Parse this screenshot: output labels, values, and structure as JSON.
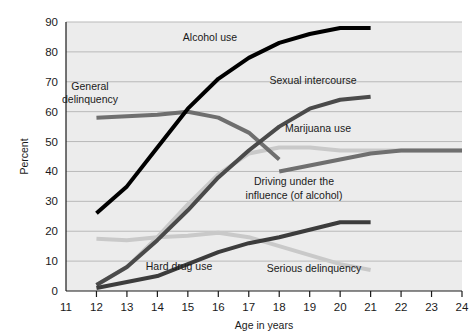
{
  "chart_data": {
    "type": "line",
    "title": "",
    "xlabel": "Age in years",
    "ylabel": "Percent",
    "xlim": [
      11,
      24
    ],
    "ylim": [
      0,
      90
    ],
    "xticks": [
      11,
      12,
      13,
      14,
      15,
      16,
      17,
      18,
      19,
      20,
      21,
      22,
      23,
      24
    ],
    "yticks": [
      0,
      10,
      20,
      30,
      40,
      50,
      60,
      70,
      80,
      90
    ],
    "grid": true,
    "legend_position": "inline-annotations",
    "plot_background": "#ececec",
    "gridline_color": "#b9b9b9",
    "series": [
      {
        "name": "Alcohol use",
        "color": "#000000",
        "width": 4.0,
        "label_x": 210,
        "label_y": 41,
        "x": [
          12,
          13,
          14,
          15,
          16,
          17,
          18,
          19,
          20,
          21
        ],
        "y": [
          26,
          35,
          48,
          61,
          71,
          78,
          83,
          86,
          88,
          88
        ]
      },
      {
        "name": "General delinquency",
        "color": "#6f6f6f",
        "width": 4.0,
        "label_x": 90,
        "label_y": 90,
        "label_line2_y": 103,
        "label_line1": "General",
        "label_line2": "delinquency",
        "x": [
          12,
          13,
          14,
          15,
          16,
          17,
          18
        ],
        "y": [
          58,
          58.5,
          59,
          60,
          58,
          53,
          44
        ]
      },
      {
        "name": "Sexual intercourse",
        "color": "#4a4a4a",
        "width": 4.0,
        "label_x": 313,
        "label_y": 84,
        "x": [
          12,
          13,
          14,
          15,
          16,
          17,
          18,
          19,
          20,
          21
        ],
        "y": [
          2,
          8,
          17,
          27,
          38,
          47,
          55,
          61,
          64,
          65
        ]
      },
      {
        "name": "Marijuana use",
        "color": "#c9c9c9",
        "width": 4.0,
        "label_x": 318,
        "label_y": 132,
        "x": [
          12,
          13,
          14,
          15,
          16,
          17,
          18,
          19,
          20,
          21,
          22,
          23,
          24
        ],
        "y": [
          2,
          8,
          18,
          29,
          39,
          46,
          48,
          48,
          47,
          47,
          47,
          47,
          47
        ]
      },
      {
        "name": "Driving under the influence (of alcohol)",
        "color": "#6f6f6f",
        "width": 4.0,
        "label_x": 294,
        "label_y": 185,
        "label_line2_y": 199,
        "label_line1": "Driving under the",
        "label_line2": "influence (of alcohol)",
        "x": [
          18,
          19,
          20,
          21,
          22,
          23,
          24
        ],
        "y": [
          40,
          42,
          44,
          46,
          47,
          47,
          47
        ]
      },
      {
        "name": "Hard drug use",
        "color": "#3c3c3c",
        "width": 4.0,
        "label_x": 179,
        "label_y": 270,
        "x": [
          12,
          13,
          14,
          15,
          16,
          17,
          18,
          19,
          20,
          21
        ],
        "y": [
          1,
          3,
          5,
          9,
          13,
          16,
          18,
          20.5,
          23,
          23
        ]
      },
      {
        "name": "Serious delinquency",
        "color": "#c9c9c9",
        "width": 4.0,
        "label_x": 314,
        "label_y": 272,
        "x": [
          12,
          13,
          14,
          15,
          16,
          17,
          18,
          19,
          20,
          21
        ],
        "y": [
          17.5,
          17,
          18,
          18.5,
          19.5,
          18,
          15,
          12,
          9,
          7
        ]
      }
    ]
  },
  "axes": {
    "y_title": "Percent",
    "x_title": "Age in years"
  }
}
